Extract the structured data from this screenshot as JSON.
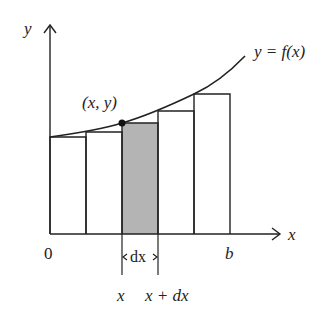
{
  "diagram": {
    "axes": {
      "x_label": "x",
      "y_label": "y",
      "origin_label": "0",
      "b_label": "b"
    },
    "curve_label": "y = f(x)",
    "point_label": "(x, y)",
    "strip": {
      "width_label": "dx",
      "left_label": "x",
      "right_label": "x + dx",
      "fill_color": "#b4b4b4"
    },
    "rectangles_count": 5,
    "shaded_rectangle_index": 2,
    "colors": {
      "line": "#222222",
      "background": "#ffffff",
      "shade": "#b4b4b4"
    }
  }
}
